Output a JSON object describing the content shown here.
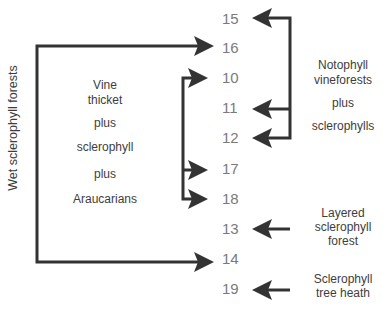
{
  "diagram": {
    "numbers": [
      {
        "id": "15",
        "label": "15",
        "y": 11
      },
      {
        "id": "16",
        "label": "16",
        "y": 40
      },
      {
        "id": "10",
        "label": "10",
        "y": 70
      },
      {
        "id": "11",
        "label": "11",
        "y": 100
      },
      {
        "id": "12",
        "label": "12",
        "y": 130
      },
      {
        "id": "17",
        "label": "17",
        "y": 161
      },
      {
        "id": "18",
        "label": "18",
        "y": 191
      },
      {
        "id": "13",
        "label": "13",
        "y": 221
      },
      {
        "id": "14",
        "label": "14",
        "y": 251
      },
      {
        "id": "19",
        "label": "19",
        "y": 281
      }
    ],
    "groups": {
      "wet_sclerophyll": {
        "label": "Wet sclerophyll forests",
        "targets": [
          "16",
          "14"
        ]
      },
      "vine_thicket": {
        "lines": [
          "Vine",
          "thicket",
          "plus",
          "sclerophyll",
          "plus",
          "Araucarians"
        ],
        "targets": [
          "10",
          "17",
          "18"
        ]
      },
      "notophyll": {
        "lines": [
          "Notophyll",
          "vineforests",
          "plus",
          "sclerophylls"
        ],
        "targets": [
          "15",
          "11",
          "12"
        ]
      },
      "layered": {
        "lines": [
          "Layered",
          "sclerophyll",
          "forest"
        ],
        "targets": [
          "13"
        ]
      },
      "tree_heath": {
        "lines": [
          "Sclerophyll",
          "tree heath"
        ],
        "targets": [
          "19"
        ]
      }
    },
    "colors": {
      "arrow": "#333333",
      "number_text": "#7a7a7a",
      "label_text": "#3d3d3d",
      "background": "#ffffff"
    }
  }
}
